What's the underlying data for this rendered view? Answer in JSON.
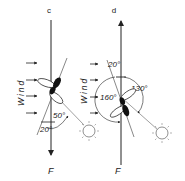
{
  "panels": [
    {
      "label": "c",
      "force_label": "F",
      "wind_label": "Wind",
      "angles": [
        "50°",
        "20°"
      ]
    },
    {
      "label": "d",
      "force_label": "F",
      "wind_label": "Wind",
      "angles": [
        "20°",
        "130°",
        "160°"
      ]
    }
  ],
  "icons": [
    "sun-icon",
    "sun-icon",
    "sun-icon",
    "insect-icon",
    "insect-icon",
    "wind-arrow-icon"
  ],
  "colors": {
    "ink": "#222222",
    "background": "#ffffff"
  }
}
